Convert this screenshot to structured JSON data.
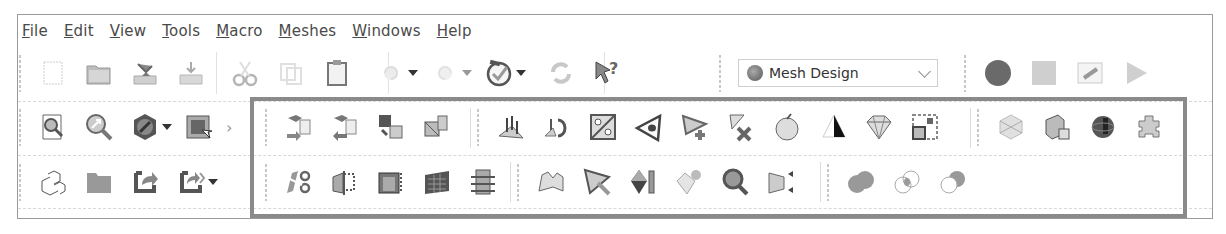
{
  "menubar": {
    "items": [
      {
        "label": "File",
        "accel": "F",
        "rest": "ile"
      },
      {
        "label": "Edit",
        "accel": "E",
        "rest": "dit"
      },
      {
        "label": "View",
        "accel": "V",
        "rest": "iew"
      },
      {
        "label": "Tools",
        "accel": "T",
        "rest": "ools"
      },
      {
        "label": "Macro",
        "accel": "M",
        "rest": "acro"
      },
      {
        "label": "Meshes",
        "accel": "M",
        "rest": "eshes"
      },
      {
        "label": "Windows",
        "accel": "W",
        "rest": "indows"
      },
      {
        "label": "Help",
        "accel": "H",
        "rest": "elp"
      }
    ]
  },
  "toolbar_row1": {
    "file_tools": [
      "new-document",
      "open-folder",
      "save",
      "save-as",
      "cut",
      "copy",
      "paste"
    ],
    "undo_redo": [
      "undo",
      "redo"
    ],
    "other": [
      "refresh-recompute",
      "refresh",
      "whats-this"
    ],
    "workbench_selector": {
      "selected": "Mesh Design"
    },
    "macro_tools": [
      "macro-record",
      "macro-stop",
      "macro-edit",
      "macro-execute"
    ]
  },
  "toolbar_row2": {
    "view_tools": [
      "fit-all",
      "fit-selection",
      "draw-style",
      "std-views"
    ],
    "mesh_import_export": [
      "import-mesh",
      "export-mesh",
      "mesh-from-shape",
      "mesh-from-shape-advanced"
    ],
    "mesh_analysis": [
      "flip-normals",
      "harmonize-normals",
      "evaluate-solid",
      "analyze-mesh",
      "add-triangle",
      "remove-components",
      "smooth-mesh",
      "fill-holes",
      "polyhedron",
      "segmentation"
    ],
    "mesh_boolean_misc": [
      "decimate",
      "mesh-box",
      "mesh-sphere",
      "add-on"
    ]
  },
  "toolbar_row3": {
    "structure_tools": [
      "part",
      "group",
      "link",
      "link-actions"
    ],
    "mesh_cutting": [
      "cut-mesh",
      "trim-mesh",
      "trim-by-plane",
      "section-from-plane",
      "cross-sections"
    ],
    "mesh_tools": [
      "curvature-plot",
      "pick-triangle",
      "split-component",
      "add-facet",
      "inspect",
      "remove-points"
    ],
    "boolean": [
      "union",
      "intersection",
      "difference"
    ]
  },
  "colors": {
    "highlight_frame": "#8a8a8a",
    "menu_text": "#4a4a4a",
    "background": "#ffffff"
  }
}
